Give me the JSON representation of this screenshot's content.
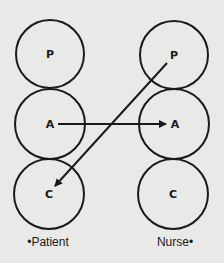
{
  "diagram": {
    "type": "transactional-analysis",
    "columns": [
      {
        "name": "Patient",
        "caption": "•Patient",
        "states": [
          "P",
          "A",
          "C"
        ]
      },
      {
        "name": "Nurse",
        "caption": "Nurse•",
        "states": [
          "P",
          "A",
          "C"
        ]
      }
    ],
    "transactions": [
      {
        "from": "Patient.A",
        "to": "Nurse.A"
      },
      {
        "from": "Nurse.P",
        "to": "Patient.C"
      }
    ]
  },
  "labels": {
    "patient_p": "P",
    "patient_a": "A",
    "patient_c": "C",
    "nurse_p": "P",
    "nurse_a": "A",
    "nurse_c": "C",
    "patient_caption": "•Patient",
    "nurse_caption": "Nurse•"
  },
  "colors": {
    "ink": "#1a1a1a",
    "paper": "#e9e9e7"
  }
}
